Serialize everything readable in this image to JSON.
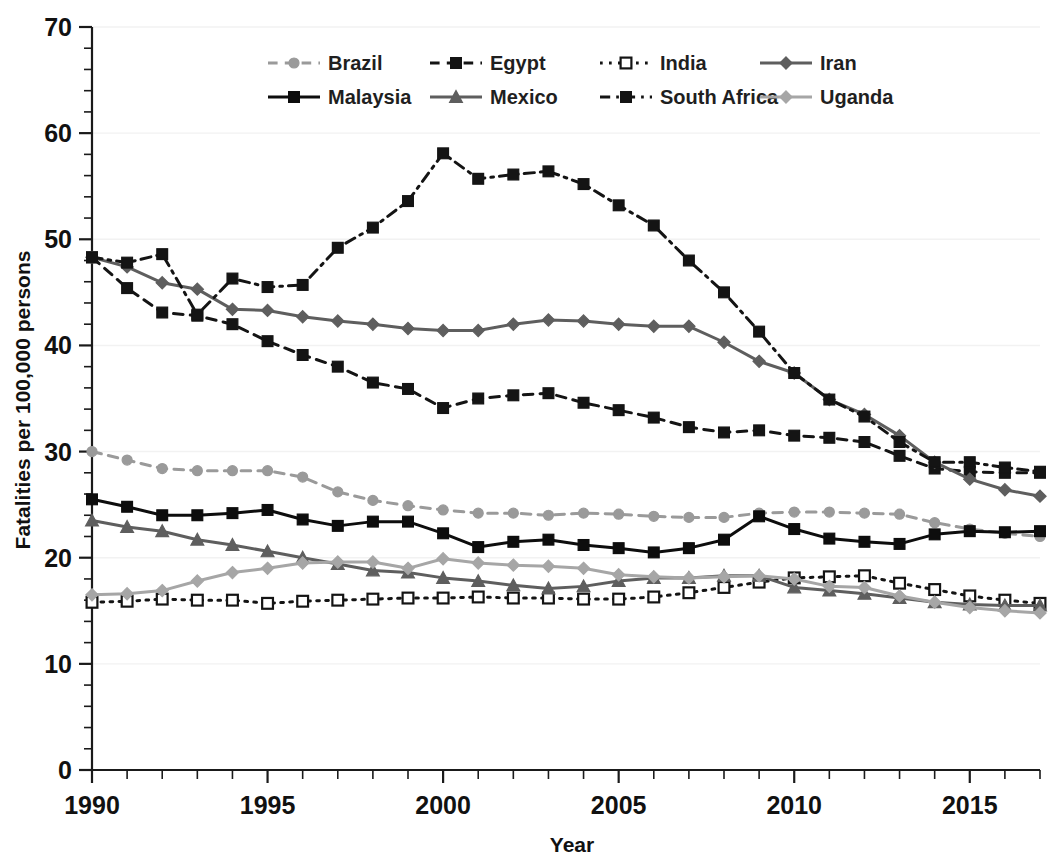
{
  "chart_data": {
    "type": "line",
    "title": "",
    "xlabel": "Year",
    "ylabel": "Fatalities per 100,000 persons",
    "xlim": [
      1990,
      2017
    ],
    "ylim": [
      0,
      70
    ],
    "y_major_step": 10,
    "y_minor_step": 2,
    "x_major_step": 5,
    "x_minor_step": 1,
    "grid": "horizontal-major-light",
    "legend_position": "top-center",
    "x_tick_labels": [
      "1990",
      "1995",
      "2000",
      "2005",
      "2010",
      "2015"
    ],
    "y_tick_labels": [
      "0",
      "10",
      "20",
      "30",
      "40",
      "50",
      "60",
      "70"
    ],
    "x": [
      1990,
      1991,
      1992,
      1993,
      1994,
      1995,
      1996,
      1997,
      1998,
      1999,
      2000,
      2001,
      2002,
      2003,
      2004,
      2005,
      2006,
      2007,
      2008,
      2009,
      2010,
      2011,
      2012,
      2013,
      2014,
      2015,
      2016,
      2017
    ],
    "series": [
      {
        "name": "Brazil",
        "color": "#9a9a9a",
        "line_style": "dashed",
        "marker": "circle",
        "marker_fill": "#9a9a9a",
        "values": [
          30.0,
          29.2,
          28.4,
          28.2,
          28.2,
          28.2,
          27.6,
          26.2,
          25.4,
          24.9,
          24.5,
          24.2,
          24.2,
          24.0,
          24.2,
          24.1,
          23.9,
          23.8,
          23.8,
          24.2,
          24.3,
          24.3,
          24.2,
          24.1,
          23.3,
          22.7,
          22.3,
          22.0
        ]
      },
      {
        "name": "Egypt",
        "color": "#141414",
        "line_style": "dashed",
        "marker": "square",
        "marker_fill": "#141414",
        "values": [
          48.3,
          45.4,
          43.1,
          42.8,
          42.0,
          40.4,
          39.1,
          38.0,
          36.5,
          35.9,
          34.1,
          35.0,
          35.3,
          35.5,
          34.6,
          33.9,
          33.2,
          32.3,
          31.8,
          32.0,
          31.5,
          31.3,
          30.9,
          29.6,
          28.4,
          28.1,
          28.0,
          28.0
        ]
      },
      {
        "name": "India",
        "color": "#141414",
        "line_style": "dotted",
        "marker": "square-hollow",
        "marker_fill": "#ffffff",
        "values": [
          15.8,
          15.9,
          16.1,
          16.0,
          16.0,
          15.7,
          15.9,
          16.0,
          16.1,
          16.2,
          16.2,
          16.3,
          16.2,
          16.2,
          16.1,
          16.1,
          16.3,
          16.7,
          17.2,
          17.7,
          18.1,
          18.2,
          18.3,
          17.6,
          17.0,
          16.4,
          16.0,
          15.7
        ]
      },
      {
        "name": "Iran",
        "color": "#5e5e5e",
        "line_style": "solid",
        "marker": "diamond",
        "marker_fill": "#5e5e5e",
        "values": [
          48.3,
          47.4,
          45.9,
          45.3,
          43.4,
          43.3,
          42.7,
          42.3,
          42.0,
          41.6,
          41.4,
          41.4,
          42.0,
          42.4,
          42.3,
          42.0,
          41.8,
          41.8,
          40.3,
          38.5,
          37.4,
          34.9,
          33.5,
          31.5,
          29.0,
          27.4,
          26.4,
          25.8
        ]
      },
      {
        "name": "Malaysia",
        "color": "#0d0d0d",
        "line_style": "solid",
        "marker": "square",
        "marker_fill": "#0d0d0d",
        "values": [
          25.5,
          24.8,
          24.0,
          24.0,
          24.2,
          24.5,
          23.6,
          23.0,
          23.4,
          23.4,
          22.3,
          21.0,
          21.5,
          21.7,
          21.2,
          20.9,
          20.5,
          20.9,
          21.7,
          23.9,
          22.7,
          21.8,
          21.5,
          21.3,
          22.2,
          22.5,
          22.4,
          22.5
        ]
      },
      {
        "name": "Mexico",
        "color": "#5e5e5e",
        "line_style": "solid",
        "marker": "triangle",
        "marker_fill": "#5e5e5e",
        "values": [
          23.5,
          22.9,
          22.5,
          21.7,
          21.2,
          20.6,
          20.0,
          19.4,
          18.8,
          18.6,
          18.1,
          17.8,
          17.4,
          17.1,
          17.3,
          17.8,
          18.1,
          18.1,
          18.3,
          18.3,
          17.2,
          16.9,
          16.6,
          16.2,
          15.8,
          15.6,
          15.5,
          15.5
        ]
      },
      {
        "name": "South Africa",
        "color": "#141414",
        "line_style": "dashdot",
        "marker": "square",
        "marker_fill": "#141414",
        "values": [
          48.3,
          47.8,
          48.6,
          42.9,
          46.3,
          45.5,
          45.7,
          49.2,
          51.1,
          53.6,
          58.1,
          55.7,
          56.1,
          56.4,
          55.2,
          53.2,
          51.3,
          48.0,
          45.0,
          41.3,
          37.4,
          34.9,
          33.3,
          30.9,
          29.0,
          29.0,
          28.5,
          28.1
        ]
      },
      {
        "name": "Uganda",
        "color": "#a6a6a6",
        "line_style": "solid",
        "marker": "diamond",
        "marker_fill": "#a6a6a6",
        "values": [
          16.5,
          16.6,
          16.9,
          17.8,
          18.6,
          19.0,
          19.5,
          19.6,
          19.6,
          19.0,
          19.9,
          19.5,
          19.3,
          19.2,
          19.0,
          18.4,
          18.2,
          18.1,
          18.2,
          18.3,
          18.0,
          17.3,
          17.2,
          16.4,
          15.8,
          15.3,
          15.0,
          14.8
        ]
      }
    ]
  },
  "legend": {
    "row1": [
      "Brazil",
      "Egypt",
      "India",
      "Iran"
    ],
    "row2": [
      "Malaysia",
      "Mexico",
      "South Africa",
      "Uganda"
    ]
  }
}
